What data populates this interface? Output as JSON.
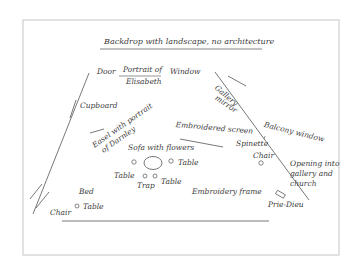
{
  "diagram": {
    "title": "Backdrop with landscape, no architecture",
    "labels": {
      "door": "Door",
      "portrait_top": "Portrait of",
      "portrait_bottom": "Elisabeth",
      "window": "Window",
      "gallery_mirror_1": "Gallery",
      "gallery_mirror_2": "mirror",
      "cupboard": "Cupboard",
      "easel_1": "Easel with portrait",
      "easel_2": "of Darnley",
      "embroidered_screen": "Embroidered screen",
      "balcony_window": "Balcony window",
      "sofa": "Sofa with flowers",
      "spinette": "Spinette",
      "chair_right": "Chair",
      "opening_1": "Opening into",
      "opening_2": "gallery and",
      "opening_3": "church",
      "table_right_of_sofa": "Table",
      "table_left": "Table",
      "trap": "Trap",
      "table_center": "Table",
      "embroidery_frame": "Embroidery frame",
      "bed": "Bed",
      "table_bed": "Table",
      "chair_left": "Chair",
      "prie_dieu": "Prie-Dieu"
    },
    "colors": {
      "line": "#555555",
      "frame": "#bbbbbb",
      "text": "#3c3c3c"
    }
  }
}
